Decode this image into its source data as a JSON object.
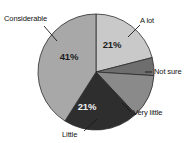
{
  "chart_data": {
    "type": "pie",
    "title": "",
    "subtitle": "",
    "xlabel": "",
    "ylabel": "",
    "legend_position": "none",
    "grid": false,
    "labels_style": "external-with-leader-lines",
    "categories": [
      "A lot",
      "Not sure",
      "Very little",
      "Little",
      "Considerable"
    ],
    "values": [
      21,
      5,
      12,
      21,
      41
    ],
    "units": "%",
    "slices": [
      {
        "label": "A lot",
        "value": 21,
        "value_label": "21%",
        "value_label_shown": true,
        "color": "#c9c9c9",
        "start_angle_deg": 0,
        "end_angle_deg": 75.6
      },
      {
        "label": "Not sure",
        "value": 5,
        "value_label": "",
        "value_label_shown": false,
        "color": "#6e6e6e",
        "start_angle_deg": 75.6,
        "end_angle_deg": 93.6
      },
      {
        "label": "Very little",
        "value": 12,
        "value_label": "",
        "value_label_shown": false,
        "color": "#8a8a8a",
        "start_angle_deg": 93.6,
        "end_angle_deg": 136.8
      },
      {
        "label": "Little",
        "value": 21,
        "value_label": "21%",
        "value_label_shown": true,
        "color": "#2e2e2e",
        "start_angle_deg": 136.8,
        "end_angle_deg": 212.4
      },
      {
        "label": "Considerable",
        "value": 41,
        "value_label": "41%",
        "value_label_shown": true,
        "color": "#a8a8a8",
        "start_angle_deg": 212.4,
        "end_angle_deg": 360
      }
    ],
    "colors": {
      "a_lot": "#c9c9c9",
      "not_sure": "#6e6e6e",
      "very_little": "#8a8a8a",
      "little": "#2e2e2e",
      "considerable": "#a8a8a8",
      "outline": "#2b2b2b",
      "background": "#ffffff",
      "text": "#111111"
    }
  },
  "labels": {
    "considerable": "Considerable",
    "a_lot": "A lot",
    "not_sure": "Not sure",
    "very_little": "Very little",
    "little": "Little"
  },
  "percent_labels": {
    "a_lot": "21%",
    "little": "21%",
    "considerable": "41%"
  }
}
